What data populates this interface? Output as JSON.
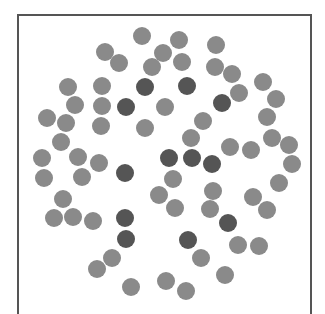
{
  "figure": {
    "colors": {
      "light": "#8a8a8a",
      "dark": "#555555",
      "frame": "#555555"
    },
    "particle_diameter": 18,
    "particles": [
      {
        "x": 142,
        "y": 36,
        "t": "light"
      },
      {
        "x": 179,
        "y": 40,
        "t": "light"
      },
      {
        "x": 216,
        "y": 45,
        "t": "light"
      },
      {
        "x": 105,
        "y": 52,
        "t": "light"
      },
      {
        "x": 163,
        "y": 53,
        "t": "light"
      },
      {
        "x": 119,
        "y": 63,
        "t": "light"
      },
      {
        "x": 152,
        "y": 67,
        "t": "light"
      },
      {
        "x": 182,
        "y": 62,
        "t": "light"
      },
      {
        "x": 215,
        "y": 67,
        "t": "light"
      },
      {
        "x": 232,
        "y": 74,
        "t": "light"
      },
      {
        "x": 263,
        "y": 82,
        "t": "light"
      },
      {
        "x": 68,
        "y": 87,
        "t": "light"
      },
      {
        "x": 102,
        "y": 86,
        "t": "light"
      },
      {
        "x": 145,
        "y": 87,
        "t": "dark"
      },
      {
        "x": 187,
        "y": 86,
        "t": "dark"
      },
      {
        "x": 239,
        "y": 93,
        "t": "light"
      },
      {
        "x": 276,
        "y": 99,
        "t": "light"
      },
      {
        "x": 75,
        "y": 105,
        "t": "light"
      },
      {
        "x": 102,
        "y": 106,
        "t": "light"
      },
      {
        "x": 126,
        "y": 107,
        "t": "dark"
      },
      {
        "x": 165,
        "y": 107,
        "t": "light"
      },
      {
        "x": 222,
        "y": 103,
        "t": "dark"
      },
      {
        "x": 47,
        "y": 118,
        "t": "light"
      },
      {
        "x": 66,
        "y": 123,
        "t": "light"
      },
      {
        "x": 101,
        "y": 126,
        "t": "light"
      },
      {
        "x": 145,
        "y": 128,
        "t": "light"
      },
      {
        "x": 203,
        "y": 121,
        "t": "light"
      },
      {
        "x": 267,
        "y": 117,
        "t": "light"
      },
      {
        "x": 61,
        "y": 142,
        "t": "light"
      },
      {
        "x": 191,
        "y": 138,
        "t": "light"
      },
      {
        "x": 272,
        "y": 138,
        "t": "light"
      },
      {
        "x": 289,
        "y": 145,
        "t": "light"
      },
      {
        "x": 230,
        "y": 147,
        "t": "light"
      },
      {
        "x": 251,
        "y": 150,
        "t": "light"
      },
      {
        "x": 42,
        "y": 158,
        "t": "light"
      },
      {
        "x": 78,
        "y": 157,
        "t": "light"
      },
      {
        "x": 99,
        "y": 163,
        "t": "light"
      },
      {
        "x": 169,
        "y": 158,
        "t": "dark"
      },
      {
        "x": 192,
        "y": 158,
        "t": "dark"
      },
      {
        "x": 212,
        "y": 164,
        "t": "dark"
      },
      {
        "x": 292,
        "y": 164,
        "t": "light"
      },
      {
        "x": 44,
        "y": 178,
        "t": "light"
      },
      {
        "x": 82,
        "y": 177,
        "t": "light"
      },
      {
        "x": 125,
        "y": 173,
        "t": "dark"
      },
      {
        "x": 173,
        "y": 179,
        "t": "light"
      },
      {
        "x": 279,
        "y": 183,
        "t": "light"
      },
      {
        "x": 63,
        "y": 199,
        "t": "light"
      },
      {
        "x": 159,
        "y": 195,
        "t": "light"
      },
      {
        "x": 213,
        "y": 191,
        "t": "light"
      },
      {
        "x": 253,
        "y": 197,
        "t": "light"
      },
      {
        "x": 54,
        "y": 218,
        "t": "light"
      },
      {
        "x": 73,
        "y": 217,
        "t": "light"
      },
      {
        "x": 93,
        "y": 221,
        "t": "light"
      },
      {
        "x": 125,
        "y": 218,
        "t": "dark"
      },
      {
        "x": 175,
        "y": 208,
        "t": "light"
      },
      {
        "x": 210,
        "y": 209,
        "t": "light"
      },
      {
        "x": 267,
        "y": 210,
        "t": "light"
      },
      {
        "x": 228,
        "y": 223,
        "t": "dark"
      },
      {
        "x": 126,
        "y": 239,
        "t": "dark"
      },
      {
        "x": 188,
        "y": 240,
        "t": "dark"
      },
      {
        "x": 238,
        "y": 245,
        "t": "light"
      },
      {
        "x": 259,
        "y": 246,
        "t": "light"
      },
      {
        "x": 112,
        "y": 258,
        "t": "light"
      },
      {
        "x": 201,
        "y": 258,
        "t": "light"
      },
      {
        "x": 97,
        "y": 269,
        "t": "light"
      },
      {
        "x": 225,
        "y": 275,
        "t": "light"
      },
      {
        "x": 131,
        "y": 287,
        "t": "light"
      },
      {
        "x": 166,
        "y": 281,
        "t": "light"
      },
      {
        "x": 186,
        "y": 291,
        "t": "light"
      }
    ]
  }
}
